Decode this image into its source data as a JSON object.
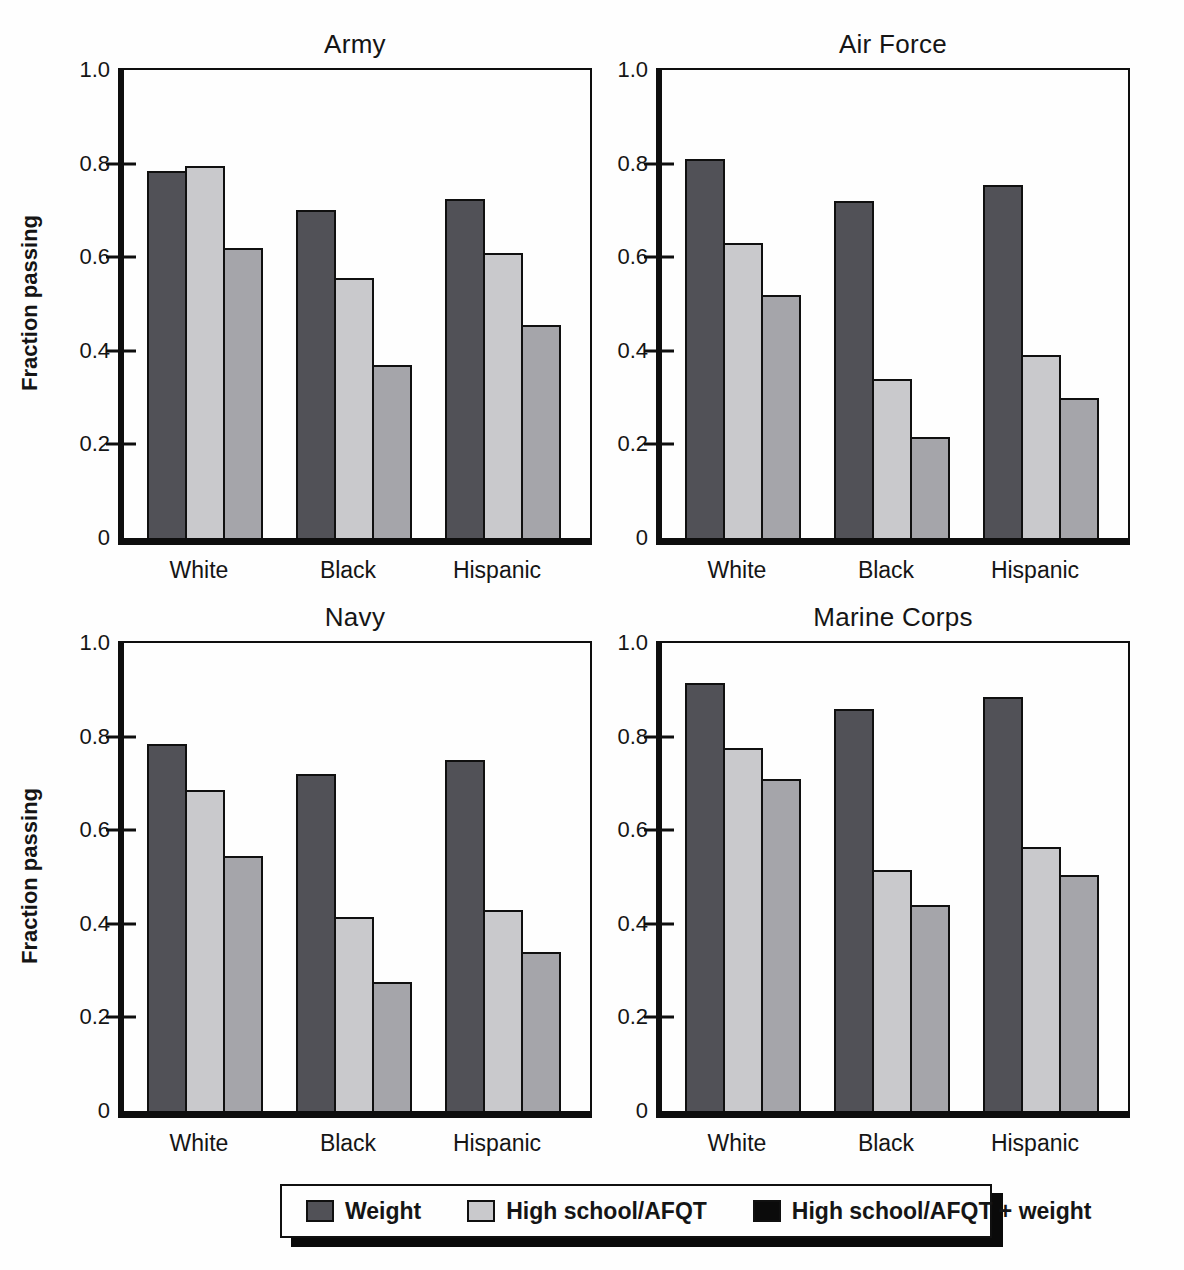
{
  "figure": {
    "ylabel": "Fraction passing",
    "categories": [
      "White",
      "Black",
      "Hispanic"
    ],
    "ylim": [
      0,
      1.0
    ],
    "y_ticks": [
      {
        "label": "1.0",
        "value": 1.0
      },
      {
        "label": "0.8",
        "value": 0.8
      },
      {
        "label": "0.6",
        "value": 0.6
      },
      {
        "label": "0.4",
        "value": 0.4
      },
      {
        "label": "0.2",
        "value": 0.2
      },
      {
        "label": "0",
        "value": 0
      }
    ],
    "bar_colors": [
      "#515157",
      "#c9c9cc",
      "#a5a5aa"
    ],
    "axis_color": "#0e0e0e"
  },
  "chart_data": [
    {
      "type": "bar",
      "title": "Army",
      "ylabel": "Fraction passing",
      "xlabel": "",
      "ylim": [
        0,
        1.0
      ],
      "grid": false,
      "categories": [
        "White",
        "Black",
        "Hispanic"
      ],
      "series": [
        {
          "name": "Weight",
          "values": [
            0.785,
            0.7,
            0.725
          ]
        },
        {
          "name": "High school/AFQT",
          "values": [
            0.795,
            0.555,
            0.61
          ]
        },
        {
          "name": "High school/AFQT + weight",
          "values": [
            0.62,
            0.37,
            0.455
          ]
        }
      ]
    },
    {
      "type": "bar",
      "title": "Air Force",
      "ylabel": "Fraction passing",
      "xlabel": "",
      "ylim": [
        0,
        1.0
      ],
      "grid": false,
      "categories": [
        "White",
        "Black",
        "Hispanic"
      ],
      "series": [
        {
          "name": "Weight",
          "values": [
            0.81,
            0.72,
            0.755
          ]
        },
        {
          "name": "High school/AFQT",
          "values": [
            0.63,
            0.34,
            0.39
          ]
        },
        {
          "name": "High school/AFQT + weight",
          "values": [
            0.52,
            0.215,
            0.3
          ]
        }
      ]
    },
    {
      "type": "bar",
      "title": "Navy",
      "ylabel": "Fraction passing",
      "xlabel": "",
      "ylim": [
        0,
        1.0
      ],
      "grid": false,
      "categories": [
        "White",
        "Black",
        "Hispanic"
      ],
      "series": [
        {
          "name": "Weight",
          "values": [
            0.785,
            0.72,
            0.75
          ]
        },
        {
          "name": "High school/AFQT",
          "values": [
            0.685,
            0.415,
            0.43
          ]
        },
        {
          "name": "High school/AFQT + weight",
          "values": [
            0.545,
            0.275,
            0.34
          ]
        }
      ]
    },
    {
      "type": "bar",
      "title": "Marine Corps",
      "ylabel": "Fraction passing",
      "xlabel": "",
      "ylim": [
        0,
        1.0
      ],
      "grid": false,
      "categories": [
        "White",
        "Black",
        "Hispanic"
      ],
      "series": [
        {
          "name": "Weight",
          "values": [
            0.915,
            0.86,
            0.885
          ]
        },
        {
          "name": "High school/AFQT",
          "values": [
            0.775,
            0.515,
            0.565
          ]
        },
        {
          "name": "High school/AFQT + weight",
          "values": [
            0.71,
            0.44,
            0.505
          ]
        }
      ]
    }
  ],
  "legend": {
    "items": [
      {
        "label": "Weight",
        "color": "#515157"
      },
      {
        "label": "High school/AFQT",
        "color": "#c9c9cc"
      },
      {
        "label": "High school/AFQT + weight",
        "color": "#0b0b0b"
      }
    ]
  }
}
